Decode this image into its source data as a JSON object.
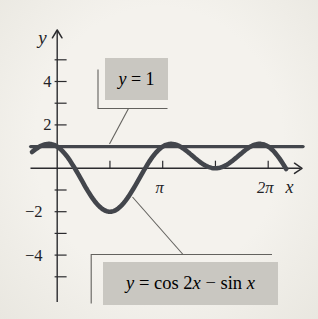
{
  "figure": {
    "bg_center": "#f4f2ed",
    "bg_edge": "#e9e7e0",
    "axis_color": "#2b2b2e",
    "curve_color": "#43464c",
    "box_bg": "#c9c7c1",
    "callout_line_color": "#63625e",
    "text_color": "#232327"
  },
  "annotations": {
    "const_label": {
      "lhs": "y",
      "eq": " = ",
      "value": "1"
    },
    "formula_label": {
      "lhs": "y",
      "mid1": " = cos 2",
      "x1": "x",
      "mid2": " − sin ",
      "x2": "x"
    }
  },
  "chart_data": {
    "type": "line",
    "title": "",
    "xlabel": "x",
    "ylabel": "y",
    "xlim": [
      -0.8,
      7.3
    ],
    "ylim": [
      -6.3,
      6.4
    ],
    "grid": false,
    "legend": "callout boxes",
    "x_ticks": [
      {
        "value": 1.5708,
        "label": ""
      },
      {
        "value": 3.1416,
        "label": "π"
      },
      {
        "value": 4.7124,
        "label": ""
      },
      {
        "value": 6.2832,
        "label": "2π"
      }
    ],
    "y_ticks": [
      {
        "value": 5,
        "label": ""
      },
      {
        "value": 4,
        "label": "4"
      },
      {
        "value": 3,
        "label": ""
      },
      {
        "value": 2,
        "label": "2"
      },
      {
        "value": 1,
        "label": ""
      },
      {
        "value": -1,
        "label": ""
      },
      {
        "value": -2,
        "label": "−2"
      },
      {
        "value": -3,
        "label": ""
      },
      {
        "value": -4,
        "label": "−4"
      },
      {
        "value": -5,
        "label": ""
      }
    ],
    "series": [
      {
        "name": "y = 1",
        "terms": [
          {
            "fn": "const",
            "coef": 1,
            "freq": 0
          }
        ],
        "domain": [
          -0.79,
          7.32
        ]
      },
      {
        "name": "y = cos 2x − sin x",
        "terms": [
          {
            "fn": "cos",
            "coef": 1,
            "freq": 2
          },
          {
            "fn": "sin",
            "coef": -1,
            "freq": 1
          }
        ],
        "domain": [
          -0.75,
          6.82
        ]
      }
    ],
    "key_points": [
      {
        "x": 0,
        "y": 1,
        "note": "y-intercept of curve"
      },
      {
        "x": 1.5708,
        "y": -2,
        "note": "absolute minimum"
      },
      {
        "x": 3.1416,
        "y": 1,
        "note": "curve touches y = 1"
      },
      {
        "x": 4.7124,
        "y": 0,
        "note": "local minimum touching x-axis"
      },
      {
        "x": 6.2832,
        "y": 1,
        "note": "curve crosses y = 1"
      }
    ]
  }
}
